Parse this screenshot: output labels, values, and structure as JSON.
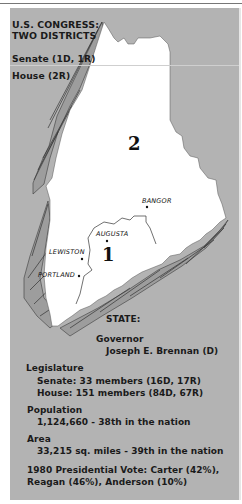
{
  "congress": {
    "title_line1": "U.S. CONGRESS:",
    "title_line2": "TWO DISTRICTS",
    "senate": "Senate (1D, 1R)",
    "house": "House (2R)"
  },
  "map": {
    "districts": [
      {
        "label": "1"
      },
      {
        "label": "2"
      }
    ],
    "cities": [
      {
        "name": "BANGOR"
      },
      {
        "name": "AUGUSTA"
      },
      {
        "name": "LEWISTON"
      },
      {
        "name": "PORTLAND"
      }
    ],
    "colors": {
      "background": "#b3b3b3",
      "land": "#ffffff",
      "shadow": "#9a9a9a",
      "outline": "#333333"
    }
  },
  "state": {
    "heading": "STATE:",
    "governor_label": "Governor",
    "governor_name": "Joseph E. Brennan (D)",
    "legislature_label": "Legislature",
    "legislature_senate": "Senate: 33 members (16D, 17R)",
    "legislature_house": "House: 151 members (84D, 67R)",
    "population_label": "Population",
    "population_value": "1,124,660 - 38th in the nation",
    "area_label": "Area",
    "area_value": "33,215 sq. miles - 39th in the nation",
    "vote_line1": "1980 Presidential Vote: Carter (42%),",
    "vote_line2": "Reagan (46%), Anderson (10%)"
  }
}
